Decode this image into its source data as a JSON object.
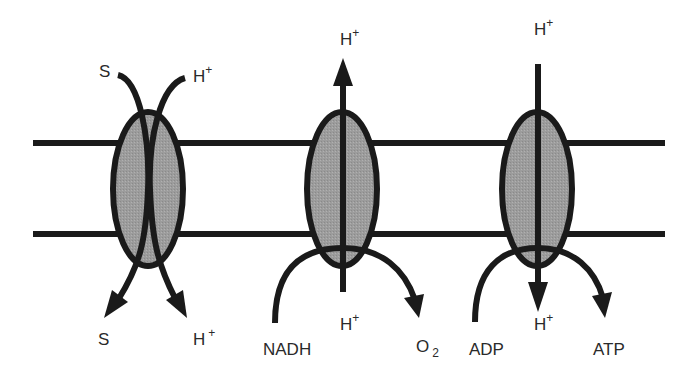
{
  "colors": {
    "stroke": "#1a1a1a",
    "protein_fill": "#9a9a9a",
    "text": "#2a2a2a",
    "background": "#ffffff"
  },
  "membrane": {
    "top_y": 143,
    "bottom_y": 234,
    "x_start": 33,
    "x_end": 665
  },
  "proteins": [
    {
      "name": "symporter",
      "labels": {
        "top_left": "S",
        "top_right": "H",
        "top_right_sup": "+",
        "bottom_left": "S",
        "bottom_right": "H",
        "bottom_right_sup": "+"
      }
    },
    {
      "name": "respiratory-chain-pump",
      "labels": {
        "top": "H",
        "top_sup": "+",
        "bottom_center": "H",
        "bottom_center_sup": "+",
        "substrate": "NADH",
        "product": "O",
        "product_sub": "2"
      }
    },
    {
      "name": "atp-synthase",
      "labels": {
        "top": "H",
        "top_sup": "+",
        "bottom_center": "H",
        "bottom_center_sup": "+",
        "substrate": "ADP",
        "product": "ATP"
      }
    }
  ]
}
